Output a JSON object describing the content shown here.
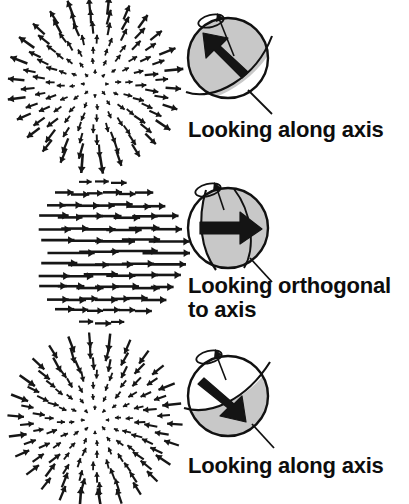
{
  "figure": {
    "background_color": "#ffffff",
    "ink_color": "#111111",
    "sphere_shade_color": "#c8c8c8",
    "sphere_outline_color": "#111111",
    "arrow_color": "#141414",
    "vector_color": "#161616"
  },
  "panels": [
    {
      "id": "panel-top",
      "caption": "Looking along axis",
      "flow_field": {
        "name": "radial-expansion-flow-field",
        "type": "radial",
        "direction": "outward",
        "center": [
          81,
          80
        ],
        "radius": 76,
        "rings": 7,
        "vectors_per_ring": [
          8,
          12,
          16,
          20,
          22,
          24,
          26
        ],
        "min_length": 3,
        "max_length": 17
      },
      "sphere": {
        "name": "sphere-looking-along-axis-top",
        "shaded_region": "upper-left",
        "body_arrow_direction": "up-left",
        "body_arrow_angle_deg": -128,
        "spin_indicator": "counter-clockwise-ellipse-top-left",
        "leader_line": "lower-right"
      }
    },
    {
      "id": "panel-middle",
      "caption": "Looking orthogonal\nto axis",
      "flow_field": {
        "name": "uniform-translation-flow-field",
        "type": "uniform-horizontal",
        "direction": "rightward",
        "center": [
          81,
          80
        ],
        "radius": 76,
        "rows": 13,
        "min_length": 14,
        "max_length": 44
      },
      "sphere": {
        "name": "sphere-looking-orthogonal-to-axis",
        "shaded_region": "right-of-meridian",
        "body_arrow_direction": "right",
        "body_arrow_angle_deg": 0,
        "spin_indicator": "counter-clockwise-ellipse-top-left",
        "leader_line": "lower-right"
      }
    },
    {
      "id": "panel-bottom",
      "caption": "Looking along axis",
      "flow_field": {
        "name": "radial-contraction-flow-field",
        "type": "radial",
        "direction": "inward",
        "center": [
          81,
          80
        ],
        "radius": 76,
        "rings": 7,
        "vectors_per_ring": [
          8,
          12,
          16,
          20,
          22,
          24,
          26
        ],
        "min_length": 3,
        "max_length": 17
      },
      "sphere": {
        "name": "sphere-looking-along-axis-bottom",
        "shaded_region": "lower-right",
        "body_arrow_direction": "down-right",
        "body_arrow_angle_deg": 52,
        "spin_indicator": "counter-clockwise-ellipse-top-left",
        "leader_line": "lower-right"
      }
    }
  ]
}
